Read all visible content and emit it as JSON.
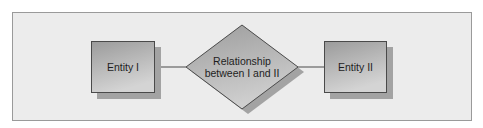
{
  "diagram": {
    "type": "entity-relationship",
    "colors": {
      "frame_background": "#ececec",
      "frame_border": "#9a9a9a",
      "shape_fill_top": "#9d9d9d",
      "shape_fill_bottom": "#d2d2d2",
      "shape_border": "#4a4a4a",
      "shadow": "#a3a3a3",
      "connector": "#4a4a4a",
      "text": "#1e1e1e"
    },
    "nodes": [
      {
        "id": "entity-1",
        "shape": "rectangle",
        "label": "Entity I"
      },
      {
        "id": "relationship",
        "shape": "diamond",
        "label_line1": "Relationship",
        "label_line2": "between I and II"
      },
      {
        "id": "entity-2",
        "shape": "rectangle",
        "label": "Entity II"
      }
    ],
    "edges": [
      {
        "from": "entity-1",
        "to": "relationship"
      },
      {
        "from": "relationship",
        "to": "entity-2"
      }
    ]
  }
}
